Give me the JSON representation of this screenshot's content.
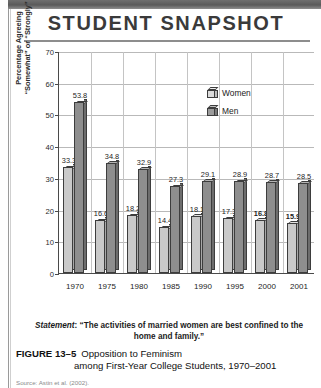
{
  "header": {
    "title": "STUDENT SNAPSHOT"
  },
  "legend": {
    "items": [
      {
        "label": "Women",
        "icon": "cube-icon",
        "color": "#c9c9c9"
      },
      {
        "label": "Men",
        "icon": "cube-icon",
        "color": "#8e8e8e"
      }
    ]
  },
  "axis": {
    "ylabel_line1": "Percentage Agreeing",
    "ylabel_line2": "“Somewhat” or “Strongly”",
    "yticks": [
      "0",
      "10",
      "20",
      "30",
      "40",
      "50",
      "60",
      "70"
    ]
  },
  "statement": {
    "prefix": "Statement",
    "text": ": “The activities of married women are best confined to the home and family.”"
  },
  "caption": {
    "label": "FIGURE 13–5",
    "line1": "Opposition to Feminism",
    "line2": "among First-Year College Students, 1970–2001"
  },
  "source": {
    "text": "Source: Astin et al. (2002)."
  },
  "chart_data": {
    "type": "bar",
    "title": "STUDENT SNAPSHOT",
    "xlabel": "",
    "ylabel": "Percentage Agreeing “Somewhat” or “Strongly”",
    "ylim": [
      0,
      70
    ],
    "ytick_step": 10,
    "grid": true,
    "legend_position": "top-center",
    "categories": [
      "1970",
      "1975",
      "1980",
      "1985",
      "1990",
      "1995",
      "2000",
      "2001"
    ],
    "series": [
      {
        "name": "Women",
        "color": "#c9c9c9",
        "values": [
          33.3,
          16.6,
          18.2,
          14.4,
          18.1,
          17.3,
          16.8,
          15.9
        ]
      },
      {
        "name": "Men",
        "color": "#8e8e8e",
        "values": [
          53.8,
          34.8,
          32.9,
          27.3,
          29.1,
          28.9,
          28.7,
          28.5
        ]
      }
    ],
    "annotations": [
      "Statement: “The activities of married women are best confined to the home and family.”"
    ]
  }
}
